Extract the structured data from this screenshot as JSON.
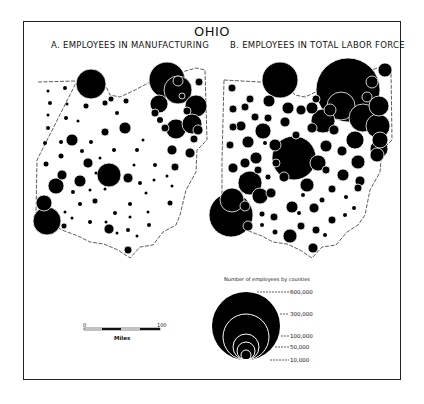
{
  "map": {
    "title": "OHIO",
    "panel_a": "A. EMPLOYEES IN MANUFACTURING",
    "panel_b": "B. EMPLOYEES IN TOTAL LABOR FORCE",
    "legend": {
      "title": "Number of employees by counties",
      "sizes": [
        "600,000",
        "300,000",
        "100,000",
        "50,000",
        "10,000"
      ]
    },
    "scale": {
      "start": "0",
      "end": "100",
      "unit": "Miles"
    },
    "colors": {
      "symbol": "#000000",
      "background": "#ffffff",
      "outline": "#333333"
    }
  }
}
